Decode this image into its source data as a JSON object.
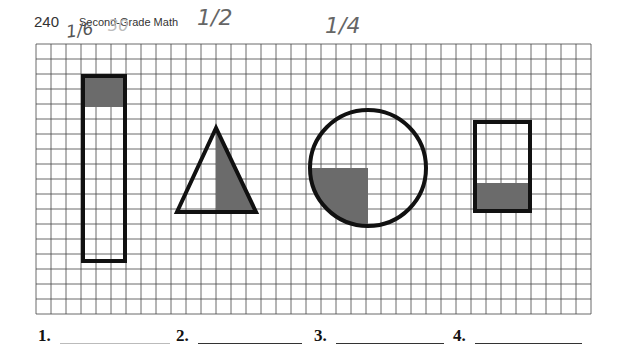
{
  "header": {
    "page_number": "240",
    "book_title": "Second-Grade Math"
  },
  "handwritten_notes": [
    {
      "text": "1/6",
      "near": "rectangle-tall"
    },
    {
      "text": "30",
      "near": "header",
      "faint": true
    },
    {
      "text": "1/2",
      "near": "triangle"
    },
    {
      "text": "1/4",
      "near": "circle"
    }
  ],
  "grid": {
    "left": 36,
    "top": 44,
    "cell": 15,
    "cols": 37,
    "rows": 18,
    "line_color": "#444444"
  },
  "shapes": [
    {
      "id": 1,
      "type": "rectangle",
      "x": 82,
      "y": 75,
      "width": 44,
      "height": 187,
      "shaded": "top 2 rows",
      "fraction_shaded": "1/6"
    },
    {
      "id": 2,
      "type": "triangle",
      "points": [
        [
          216,
          127
        ],
        [
          176,
          213
        ],
        [
          257,
          213
        ]
      ],
      "shaded": "right half",
      "fraction_shaded": "1/2"
    },
    {
      "id": 3,
      "type": "circle",
      "cx": 368,
      "cy": 168,
      "r": 58,
      "shaded": "bottom-left quarter",
      "fraction_shaded": "1/4"
    },
    {
      "id": 4,
      "type": "rectangle",
      "x": 474,
      "y": 121,
      "width": 57,
      "height": 91,
      "shaded": "bottom portion"
    }
  ],
  "colors": {
    "shade": "#6b6b6b",
    "outline": "#111111"
  },
  "answers": [
    {
      "label": "1.",
      "value": ""
    },
    {
      "label": "2.",
      "value": ""
    },
    {
      "label": "3.",
      "value": ""
    },
    {
      "label": "4.",
      "value": ""
    }
  ]
}
